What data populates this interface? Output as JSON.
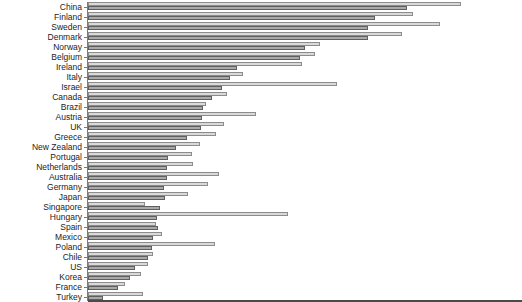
{
  "chart_data": {
    "type": "bar",
    "orientation": "horizontal",
    "title": "",
    "xlabel": "",
    "ylabel": "",
    "legend": "none",
    "x_axis_tick_labels": "none visible",
    "value_unit": "bar length in screen pixels (no numeric axis shown)",
    "xlim": [
      0,
      434
    ],
    "categories": [
      "China",
      "Finland",
      "Sweden",
      "Denmark",
      "Norway",
      "Belgium",
      "Ireland",
      "Italy",
      "Israel",
      "Canada",
      "Brazil",
      "Austria",
      "UK",
      "Greece",
      "New Zealand",
      "Portugal",
      "Netherlands",
      "Australia",
      "Germany",
      "Japan",
      "Singapore",
      "Hungary",
      "Spain",
      "Mexico",
      "Poland",
      "Chile",
      "US",
      "Korea",
      "France",
      "Turkey"
    ],
    "series": [
      {
        "name": "upper-light-gray-bar",
        "fill_color": "#d9d9d9",
        "border_color": "#8c8c8c",
        "values": [
          373,
          325,
          352,
          314,
          232,
          227,
          214,
          155,
          249,
          139,
          118,
          168,
          136,
          128,
          112,
          104,
          105,
          131,
          120,
          100,
          57,
          200,
          68,
          74,
          127,
          65,
          60,
          53,
          37,
          55
        ]
      },
      {
        "name": "lower-dark-gray-bar",
        "fill_color": "#a9a9a9",
        "border_color": "#5f5f5f",
        "values": [
          319,
          287,
          280,
          280,
          217,
          212,
          149,
          142,
          134,
          124,
          115,
          114,
          113,
          99,
          88,
          80,
          79,
          79,
          76,
          77,
          72,
          69,
          70,
          65,
          64,
          60,
          47,
          42,
          30,
          15
        ]
      }
    ],
    "axis": {
      "y_axis_line_color": "#7a7a7a",
      "x_axis_line_color": "#4a4a4a",
      "tick_marks": "short horizontal tick at each country"
    }
  }
}
